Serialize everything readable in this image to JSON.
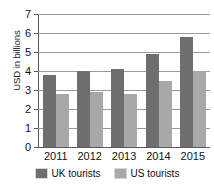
{
  "chart_data": {
    "type": "bar",
    "title": "",
    "subtitle": "",
    "xlabel": "",
    "ylabel": "USD in billions",
    "categories": [
      "2011",
      "2012",
      "2013",
      "2014",
      "2015"
    ],
    "series": [
      {
        "name": "UK tourists",
        "values": [
          3.8,
          4.0,
          4.1,
          4.9,
          5.8
        ],
        "color": "#6e6e6e"
      },
      {
        "name": "US tourists",
        "values": [
          2.8,
          2.9,
          2.8,
          3.5,
          4.0
        ],
        "color": "#a8a8a8"
      }
    ],
    "ylim": [
      0,
      7
    ],
    "y_ticks": [
      "0",
      "1",
      "2",
      "3",
      "4",
      "5",
      "6",
      "7"
    ],
    "grid": true,
    "grid_orientation": "horizontal",
    "legend_position": "bottom"
  },
  "axis": {
    "y_title": "USD in billions",
    "y_tick_labels": [
      "7",
      "6",
      "5",
      "4",
      "3",
      "2",
      "1",
      "0"
    ],
    "x_tick_labels": [
      "2011",
      "2012",
      "2013",
      "2014",
      "2015"
    ]
  },
  "legend": {
    "items": [
      {
        "label": "UK tourists",
        "swatch_name": "legend-swatch-uk"
      },
      {
        "label": "US tourists",
        "swatch_name": "legend-swatch-us"
      }
    ]
  }
}
